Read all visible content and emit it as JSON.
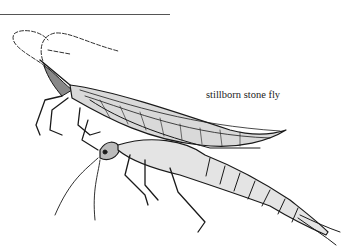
{
  "illustration": {
    "subject": "stone fly",
    "caption": "stillborn stone fly",
    "style": "pen-and-ink line drawing",
    "colors": {
      "ink": "#1a1a1a",
      "background": "#ffffff",
      "rule": "#555555"
    }
  }
}
